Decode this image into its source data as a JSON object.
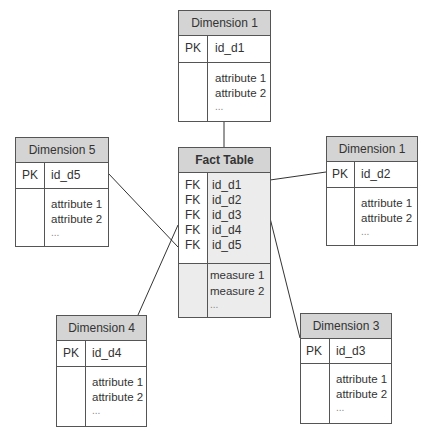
{
  "diagram": {
    "type": "star-schema",
    "fact_table": {
      "title": "Fact Table",
      "keys": [
        "FK",
        "FK",
        "FK",
        "FK",
        "FK"
      ],
      "fields": [
        "id_d1",
        "id_d2",
        "id_d3",
        "id_d4",
        "id_d5"
      ],
      "measures": [
        "measure 1",
        "measure 2",
        "..."
      ]
    },
    "dimensions": [
      {
        "id": "top",
        "title": "Dimension 1",
        "key": "PK",
        "id_field": "id_d1",
        "attributes": [
          "attribute 1",
          "attribute 2",
          "..."
        ]
      },
      {
        "id": "left",
        "title": "Dimension 5",
        "key": "PK",
        "id_field": "id_d5",
        "attributes": [
          "attribute 1",
          "attribute 2",
          "..."
        ]
      },
      {
        "id": "right",
        "title": "Dimension 1",
        "key": "PK",
        "id_field": "id_d2",
        "attributes": [
          "attribute 1",
          "attribute 2",
          "..."
        ]
      },
      {
        "id": "bottom-left",
        "title": "Dimension 4",
        "key": "PK",
        "id_field": "id_d4",
        "attributes": [
          "attribute 1",
          "attribute 2",
          "..."
        ]
      },
      {
        "id": "bottom-right",
        "title": "Dimension 3",
        "key": "PK",
        "id_field": "id_d3",
        "attributes": [
          "attribute 1",
          "attribute 2",
          "..."
        ]
      }
    ],
    "connections": [
      {
        "from": "Dimension 1 (top)",
        "to": "Fact Table"
      },
      {
        "from": "Dimension 5",
        "to": "Fact Table"
      },
      {
        "from": "Dimension 1 (right)",
        "to": "Fact Table"
      },
      {
        "from": "Dimension 4",
        "to": "Fact Table"
      },
      {
        "from": "Dimension 3",
        "to": "Fact Table"
      }
    ],
    "colors": {
      "header_fill": "#d4d4d4",
      "fact_fill": "#ececec",
      "border": "#555555",
      "line": "#333333"
    }
  }
}
